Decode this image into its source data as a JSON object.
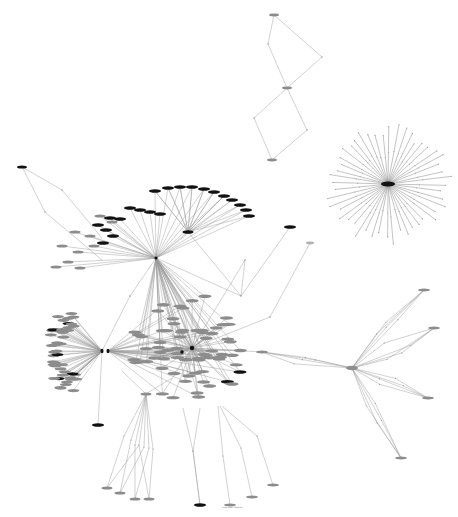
{
  "diagram": {
    "type": "network-graph",
    "width": 458,
    "height": 517,
    "background": "#ffffff",
    "colors": {
      "node_black": "#111111",
      "node_gray": "#8c8c8c",
      "edge": "#9a9a9a"
    },
    "clusters": [
      {
        "name": "top-chain",
        "nodes": [
          {
            "x": 274,
            "y": 15,
            "shade": "gray"
          },
          {
            "x": 287,
            "y": 88,
            "shade": "gray"
          },
          {
            "x": 272,
            "y": 160,
            "shade": "gray"
          }
        ],
        "waypoints": [
          [
            268,
            44
          ],
          [
            322,
            57
          ],
          [
            254,
            118
          ],
          [
            307,
            130
          ]
        ]
      },
      {
        "name": "star-burst",
        "hub": {
          "x": 388,
          "y": 184
        },
        "leaf_count": 48,
        "radius": 58
      },
      {
        "name": "upper-fan",
        "hub": {
          "x": 156,
          "y": 258
        },
        "arc_nodes": [
          [
            155,
            191
          ],
          [
            168,
            188
          ],
          [
            180,
            187
          ],
          [
            192,
            187
          ],
          [
            204,
            189
          ],
          [
            214,
            192
          ],
          [
            224,
            196
          ],
          [
            232,
            200
          ],
          [
            240,
            205
          ],
          [
            246,
            210
          ],
          [
            249,
            216
          ],
          [
            130,
            208
          ],
          [
            140,
            210
          ],
          [
            150,
            212
          ],
          [
            160,
            214
          ],
          [
            110,
            218
          ],
          [
            120,
            219
          ],
          [
            98,
            225
          ],
          [
            106,
            230
          ],
          [
            113,
            236
          ],
          [
            103,
            243
          ]
        ],
        "gray_nodes": [
          [
            100,
            216
          ],
          [
            112,
            222
          ],
          [
            75,
            232
          ],
          [
            90,
            236
          ],
          [
            94,
            246
          ],
          [
            62,
            246
          ],
          [
            78,
            252
          ],
          [
            68,
            262
          ],
          [
            56,
            267
          ],
          [
            80,
            268
          ]
        ]
      },
      {
        "name": "left-hub",
        "hub": {
          "x": 102,
          "y": 351
        },
        "hub2": {
          "x": 108,
          "y": 351
        },
        "fan_count": 45,
        "center_x": 62,
        "center_y": 351,
        "rx": 28,
        "ry": 46
      },
      {
        "name": "central-dense",
        "hub": {
          "x": 192,
          "y": 348
        },
        "hub_b": {
          "x": 182,
          "y": 352
        },
        "fan_count": 70
      },
      {
        "name": "right-star",
        "hub": {
          "x": 352,
          "y": 368
        },
        "targets": [
          {
            "x": 424,
            "y": 290
          },
          {
            "x": 434,
            "y": 328
          },
          {
            "x": 428,
            "y": 398
          },
          {
            "x": 401,
            "y": 458
          },
          {
            "x": 262,
            "y": 352
          }
        ]
      },
      {
        "name": "bottom-fan",
        "hub": {
          "x": 146,
          "y": 394
        },
        "leaves": [
          [
            107,
            488
          ],
          [
            120,
            493
          ],
          [
            135,
            499
          ],
          [
            149,
            499
          ]
        ]
      }
    ],
    "footer_label": "node label (illegible)"
  }
}
